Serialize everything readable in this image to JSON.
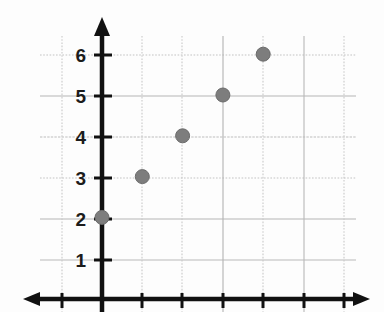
{
  "chart_data": {
    "type": "scatter",
    "title": "",
    "subtitle": "",
    "xlabel": "",
    "ylabel": "",
    "x": [
      0,
      1,
      2,
      3,
      4
    ],
    "values": [
      2,
      3,
      4,
      5,
      6
    ],
    "points": [
      {
        "x": 0,
        "y": 2
      },
      {
        "x": 1,
        "y": 3
      },
      {
        "x": 2,
        "y": 4
      },
      {
        "x": 3,
        "y": 5
      },
      {
        "x": 4,
        "y": 6
      }
    ],
    "series": [
      {
        "name": "",
        "points": [
          {
            "x": 0,
            "y": 2
          },
          {
            "x": 1,
            "y": 3
          },
          {
            "x": 2,
            "y": 4
          },
          {
            "x": 3,
            "y": 5
          },
          {
            "x": 4,
            "y": 6
          }
        ]
      }
    ],
    "xlim": [
      -1,
      6.5
    ],
    "ylim": [
      0,
      6.6
    ],
    "x_tick_labels": [],
    "y_tick_labels": [
      "1",
      "2",
      "3",
      "4",
      "5",
      "6"
    ],
    "y_ticks": [
      1,
      2,
      3,
      4,
      5,
      6
    ],
    "x_ticks": [
      -1,
      0,
      1,
      2,
      3,
      4,
      5,
      6
    ],
    "grid": true,
    "legend": null,
    "legend_position": "none",
    "annotations": [],
    "marker": {
      "shape": "circle",
      "color": "#7d7d7d",
      "edge_color": "#6b6b6b",
      "radius_px": 7
    },
    "colors": {
      "axis": "#111111",
      "grid": "#b9b9b9",
      "grid_dotted": "#c9c9c9",
      "tick_label": "#1c1c1c",
      "background": "#fdfdfd"
    },
    "axis_style": {
      "x_axis_arrow": "both",
      "y_axis_arrow": "up",
      "x_axis_label_text": "",
      "y_axis_label_text": ""
    }
  },
  "y_axis": {
    "labels": [
      {
        "text": "6",
        "value": 6,
        "px_y": 55
      },
      {
        "text": "5",
        "value": 5,
        "px_y": 96
      },
      {
        "text": "4",
        "value": 4,
        "px_y": 137
      },
      {
        "text": "3",
        "value": 3,
        "px_y": 178
      },
      {
        "text": "2",
        "value": 2,
        "px_y": 219
      },
      {
        "text": "1",
        "value": 1,
        "px_y": 260
      }
    ]
  }
}
